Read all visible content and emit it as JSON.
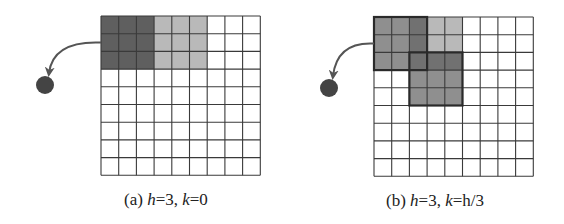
{
  "colors": {
    "grid_line": "#3a3a3a",
    "dark": "#5f5f5f",
    "light": "#b9b9b9",
    "medium": "#8f8f8f",
    "overlap": "#717171",
    "window_border": "#2a2a2a",
    "node": "#444444",
    "arrow": "#555555"
  },
  "grid": {
    "rows": 9,
    "cols": 9
  },
  "panels": [
    {
      "id": "a",
      "label_prefix": "(a) ",
      "h_var": "h",
      "h_eq": "=3, ",
      "k_var": "k",
      "k_eq": "=0",
      "origin": [
        101,
        16
      ],
      "cell": 17.7,
      "node": [
        45,
        85,
        9
      ],
      "shaded": [
        {
          "rows": [
            0,
            2
          ],
          "cols": [
            0,
            2
          ],
          "shade": "dark"
        },
        {
          "rows": [
            0,
            2
          ],
          "cols": [
            3,
            5
          ],
          "shade": "light"
        }
      ],
      "windows": []
    },
    {
      "id": "b",
      "label_prefix": "(b) ",
      "h_var": "h",
      "h_eq": "=3, ",
      "k_var": "k",
      "k_eq": "=h/3",
      "origin": [
        374,
        17
      ],
      "cell": 17.7,
      "node": [
        329,
        88,
        9
      ],
      "shaded": [
        {
          "rows": [
            0,
            2
          ],
          "cols": [
            0,
            1
          ],
          "shade": "medium"
        },
        {
          "rows": [
            0,
            1
          ],
          "cols": [
            3,
            4
          ],
          "shade": "light"
        },
        {
          "rows": [
            0,
            2
          ],
          "cols": [
            2,
            2
          ],
          "shade": "overlap"
        },
        {
          "rows": [
            2,
            2
          ],
          "cols": [
            3,
            4
          ],
          "shade": "overlap"
        },
        {
          "rows": [
            3,
            4
          ],
          "cols": [
            2,
            4
          ],
          "shade": "medium"
        }
      ],
      "windows": [
        {
          "rows": [
            0,
            2
          ],
          "cols": [
            0,
            2
          ]
        },
        {
          "rows": [
            2,
            4
          ],
          "cols": [
            2,
            4
          ]
        }
      ]
    }
  ]
}
